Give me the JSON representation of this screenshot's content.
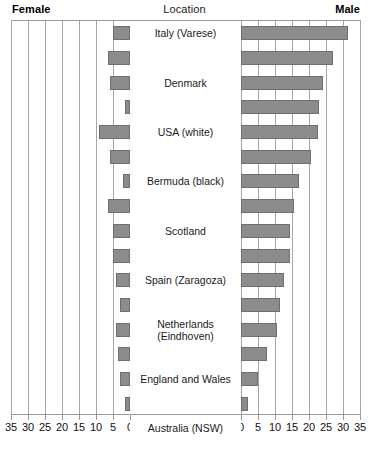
{
  "header": {
    "left_label": "Female",
    "center_label": "Location",
    "right_label": "Male"
  },
  "axis": {
    "left_ticks": [
      "35",
      "30",
      "25",
      "20",
      "15",
      "10",
      "5",
      "0"
    ],
    "right_ticks": [
      "0",
      "5",
      "10",
      "15",
      "20",
      "25",
      "30",
      "35"
    ],
    "max": 35,
    "step": 5
  },
  "colors": {
    "bar_fill": "#8c8c8c",
    "bar_stroke": "#6f6f6f",
    "gridline": "#a6a6a6",
    "frame": "#9a9a9a",
    "text": "#1a1a1a"
  },
  "chart_data": {
    "type": "bar",
    "title": "",
    "subtitle": "",
    "orientation": "horizontal-bilateral",
    "xlabel": "",
    "ylabel": "Location",
    "xlim": [
      0,
      35
    ],
    "grid": true,
    "legend_position": "top",
    "categories": [
      "Italy (Varese)",
      "Denmark",
      "USA (white)",
      "Bermuda (black)",
      "Scotland",
      "Spain (Zaragoza)",
      "Netherlands (Eindhoven)",
      "England and Wales",
      "Australia (NSW)",
      "Hong Kong",
      "France (Calvados)",
      "Poland (Warsaw)",
      "USA (black)",
      "Japan (Osaka)",
      "China (Tianjin)",
      "India (Bombay)"
    ],
    "series": [
      {
        "name": "Female",
        "side": "left",
        "values": [
          5,
          6.5,
          6,
          1.5,
          9,
          6,
          2,
          6.5,
          5,
          5,
          4,
          3,
          4,
          3.5,
          3,
          1.5
        ]
      },
      {
        "name": "Male",
        "side": "right",
        "values": [
          31.5,
          27,
          24,
          23,
          22.5,
          20.5,
          17,
          15.5,
          14.5,
          14.5,
          12.5,
          11.5,
          10.5,
          7.5,
          5,
          2
        ]
      }
    ]
  },
  "rows": [
    {
      "label": "Italy (Varese)",
      "female": 5,
      "male": 31.5,
      "two_line": false
    },
    {
      "label": "Denmark",
      "female": 6.5,
      "male": 27,
      "two_line": false
    },
    {
      "label": "USA (white)",
      "female": 6,
      "male": 24,
      "two_line": false
    },
    {
      "label": "Bermuda (black)",
      "female": 1.5,
      "male": 23,
      "two_line": false
    },
    {
      "label": "Scotland",
      "female": 9,
      "male": 22.5,
      "two_line": false
    },
    {
      "label": "Spain (Zaragoza)",
      "female": 6,
      "male": 20.5,
      "two_line": false
    },
    {
      "label": "Netherlands (Eindhoven)",
      "female": 2,
      "male": 17,
      "two_line": true
    },
    {
      "label": "England and Wales",
      "female": 6.5,
      "male": 15.5,
      "two_line": false
    },
    {
      "label": "Australia (NSW)",
      "female": 5,
      "male": 14.5,
      "two_line": false
    },
    {
      "label": "Hong Kong",
      "female": 5,
      "male": 14.5,
      "two_line": false
    },
    {
      "label": "France (Calvados)",
      "female": 4,
      "male": 12.5,
      "two_line": false
    },
    {
      "label": "Poland (Warsaw)",
      "female": 3,
      "male": 11.5,
      "two_line": false
    },
    {
      "label": "USA (black)",
      "female": 4,
      "male": 10.5,
      "two_line": false
    },
    {
      "label": "Japan (Osaka)",
      "female": 3.5,
      "male": 7.5,
      "two_line": false
    },
    {
      "label": "China (Tianjin)",
      "female": 3,
      "male": 5,
      "two_line": false
    },
    {
      "label": "India (Bombay)",
      "female": 1.5,
      "male": 2,
      "two_line": false
    }
  ]
}
